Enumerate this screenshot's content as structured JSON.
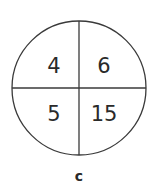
{
  "diagram": {
    "type": "circle-quadrants",
    "quadrants": {
      "top_left": "4",
      "top_right": "6",
      "bottom_left": "5",
      "bottom_right": "15"
    },
    "label": "c",
    "stroke_color": "#3a3a3a",
    "text_color": "#2a2a2a"
  }
}
